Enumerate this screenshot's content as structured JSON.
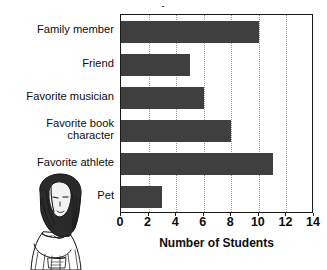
{
  "title_partial": "·",
  "chart_data": {
    "type": "bar",
    "orientation": "horizontal",
    "title": "",
    "xlabel": "Number of Students",
    "ylabel": "",
    "categories": [
      "Family member",
      "Friend",
      "Favorite musician",
      "Favorite book\ncharacter",
      "Favorite athlete",
      "Pet"
    ],
    "values": [
      10,
      5,
      6,
      8,
      11,
      3
    ],
    "xlim": [
      0,
      14
    ],
    "xticks": [
      0,
      2,
      4,
      6,
      8,
      10,
      12,
      14
    ],
    "xtick_labels": [
      "0",
      "2",
      "4",
      "6",
      "8",
      "10",
      "12",
      "14"
    ],
    "grid": "vertical-dotted",
    "legend": "none",
    "bar_color": "#3f3f3f",
    "axis_color": "#1a1a1a",
    "grid_color": "#9a9a9a",
    "background": "#ffffff"
  },
  "illustration": {
    "name": "girl-line-drawing",
    "description": "Pen-and-ink illustration of a long-haired girl in a dress, lower-left corner"
  }
}
